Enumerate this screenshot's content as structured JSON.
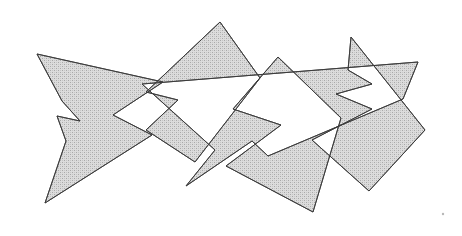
{
  "figure": {
    "width": 462,
    "height": 236,
    "background_color": "#ffffff",
    "fill_color": "#d2d2d2",
    "stroke_color": "#3a3a3a",
    "stroke_width": 0.9,
    "fill_pattern": "stipple-halftone",
    "fill_rule": "evenodd",
    "polygons": [
      {
        "name": "left-arrow-polygon",
        "label": "P1",
        "points": "37,54 163,82 113,115 152,135 45,203 66,141 57,116 80,121 62,101"
      },
      {
        "name": "upper-middle-triangle-polygon",
        "label": "P2",
        "points": "220,22 260,78 195,162 146,130 178,100 146,92"
      },
      {
        "name": "long-band-polygon",
        "label": "P3",
        "points": "142,84 418,62 403,99 268,156 252,141 186,186 215,150"
      },
      {
        "name": "right-notched-polygon",
        "label": "P4",
        "points": "278,57 341,118 313,212 226,166 281,125 233,109"
      },
      {
        "name": "right-bracket-polygon",
        "label": "P5",
        "points": "351,37 425,130 369,191 312,140 372,109 336,94 372,84 348,70"
      }
    ],
    "corner_dot": {
      "name": "page-corner-mark",
      "x": 443,
      "y": 214,
      "radius": 1.2,
      "color": "#b8b8b8"
    }
  }
}
